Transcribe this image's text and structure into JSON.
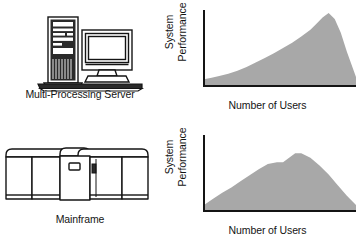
{
  "figure": {
    "background_color": "#ffffff",
    "ink_color": "#1a1a1a",
    "fill_color": "#a8a8a8",
    "axis_color": "#141414"
  },
  "rows": [
    {
      "device": {
        "icon": "tower-server-and-monitor-icon",
        "caption": "Multi-Processing Server"
      },
      "chart": {
        "ylabel_line1": "System",
        "ylabel_line2": "Performance",
        "xlabel": "Number of Users"
      }
    },
    {
      "device": {
        "icon": "mainframe-cabinets-icon",
        "caption": "Mainframe"
      },
      "chart": {
        "ylabel_line1": "System",
        "ylabel_line2": "Performance",
        "xlabel": "Number of Users"
      }
    }
  ],
  "chart_data": [
    {
      "type": "area",
      "title": "Multi-Processing Server performance vs. users",
      "xlabel": "Number of Users",
      "ylabel": "System Performance",
      "xlim": [
        0,
        100
      ],
      "ylim": [
        0,
        100
      ],
      "grid": false,
      "legend": false,
      "axis_ticks": false,
      "fill_color": "#a8a8a8",
      "x": [
        0,
        5,
        10,
        16,
        22,
        28,
        34,
        40,
        46,
        52,
        58,
        64,
        70,
        74,
        78,
        82,
        86,
        90,
        94,
        100
      ],
      "y": [
        9,
        11,
        13,
        16,
        20,
        25,
        31,
        37,
        43,
        50,
        57,
        65,
        74,
        82,
        90,
        96,
        88,
        70,
        45,
        12
      ],
      "annotation": "Performance climbs steadily with users, peaks near the high end, then falls off sharply."
    },
    {
      "type": "area",
      "title": "Mainframe performance vs. users",
      "xlabel": "Number of Users",
      "ylabel": "System Performance",
      "xlim": [
        0,
        100
      ],
      "ylim": [
        0,
        100
      ],
      "grid": false,
      "legend": false,
      "axis_ticks": false,
      "fill_color": "#a8a8a8",
      "x": [
        0,
        6,
        12,
        18,
        24,
        30,
        36,
        42,
        48,
        52,
        56,
        60,
        64,
        70,
        76,
        82,
        88,
        94,
        100
      ],
      "y": [
        8,
        16,
        24,
        31,
        39,
        47,
        55,
        62,
        64,
        64,
        70,
        76,
        76,
        70,
        60,
        48,
        34,
        20,
        8
      ],
      "annotation": "Performance rises, briefly plateaus, reaches a flat peak, then declines gradually."
    }
  ]
}
